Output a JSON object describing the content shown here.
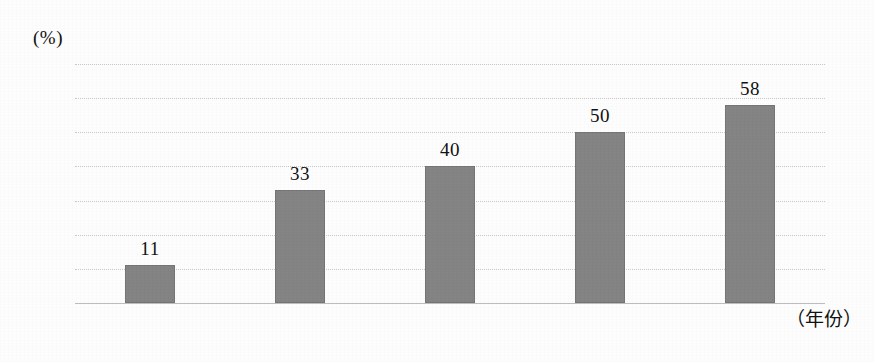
{
  "chart_data": {
    "type": "bar",
    "title": "",
    "subtitle": "",
    "unit_label": "(%)",
    "categories": [
      "2007",
      "2009",
      "2011",
      "2013",
      "2015"
    ],
    "values": [
      11,
      33,
      40,
      50,
      58
    ],
    "series": [
      {
        "name": "",
        "values": [
          11,
          33,
          40,
          50,
          58
        ]
      }
    ],
    "xlabel": "（年份）",
    "ylabel": "(%)",
    "ylim": [
      0,
      70
    ],
    "yticks": [
      70,
      60,
      50,
      40,
      30,
      20,
      10,
      0
    ],
    "ytick_labels": [
      "70",
      "60",
      "50",
      "40",
      "30",
      "20",
      "10",
      "0"
    ],
    "data_labels": [
      "11",
      "33",
      "40",
      "50",
      "58"
    ],
    "grid": true,
    "grid_axis": "y",
    "legend": false,
    "legend_position": "none",
    "bar_color": "#848484",
    "grid_color": "#c9c9c9",
    "axis_color": "#bdbdbd",
    "text_color": "#111111",
    "background_color": "#fdfdfd"
  }
}
